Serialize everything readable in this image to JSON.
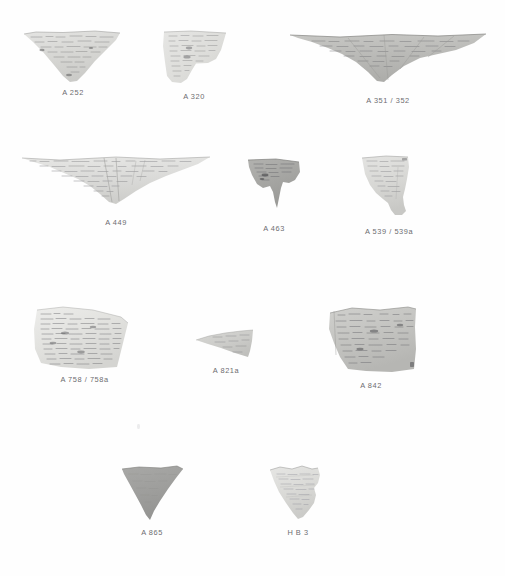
{
  "plate": {
    "title": "Manuscript fragments plate",
    "background_color": "#ffffff",
    "label_color": "#6d6d70",
    "width": 505,
    "height": 576,
    "row_count": 4,
    "fragment_count": 11
  },
  "fragments": [
    {
      "id": "a-252",
      "label": "A 252",
      "row": 1,
      "shape": "inverted-triangle-wedge",
      "fill": "#d8d8d6",
      "tone": "light",
      "x": 23,
      "y": 30,
      "w": 100,
      "h": 55,
      "label_y": 58,
      "ink": "dense-handwriting"
    },
    {
      "id": "a-320",
      "label": "A 320",
      "row": 1,
      "shape": "right-triangle-step",
      "fill": "#dededc",
      "tone": "light",
      "x": 160,
      "y": 30,
      "w": 68,
      "h": 54,
      "label_y": 62,
      "ink": "dense-handwriting"
    },
    {
      "id": "a-351-352",
      "label": "A 351 / 352",
      "row": 1,
      "shape": "wide-chevron",
      "fill": "#b9b9b6",
      "tone": "medium",
      "x": 288,
      "y": 33,
      "w": 200,
      "h": 52,
      "label_y": 63,
      "ink": "dense-handwriting"
    },
    {
      "id": "a-449",
      "label": "A 449",
      "row": 2,
      "shape": "wide-chevron-shallow",
      "fill": "#dcdcda",
      "tone": "light",
      "x": 20,
      "y": 155,
      "w": 192,
      "h": 52,
      "label_y": 63,
      "ink": "dense-handwriting"
    },
    {
      "id": "a-463",
      "label": "A 463",
      "row": 2,
      "shape": "notched-triangle-with-tail",
      "fill": "#a9a9a6",
      "tone": "dark",
      "x": 243,
      "y": 158,
      "w": 62,
      "h": 62,
      "label_y": 66,
      "ink": "sparse-handwriting"
    },
    {
      "id": "a-539-539a",
      "label": "A 539 / 539a",
      "row": 2,
      "shape": "tapered-keystone-with-foot",
      "fill": "#dadad8",
      "tone": "light",
      "x": 358,
      "y": 155,
      "w": 62,
      "h": 68,
      "label_y": 72,
      "ink": "dense-handwriting"
    },
    {
      "id": "a-758-758a",
      "label": "A 758 / 758a",
      "row": 3,
      "shape": "quadrilateral-sheet",
      "fill": "#e2e2e0",
      "tone": "light",
      "x": 33,
      "y": 305,
      "w": 103,
      "h": 66,
      "label_y": 70,
      "ink": "very-dense-handwriting"
    },
    {
      "id": "a-821a",
      "label": "A 821a",
      "row": 3,
      "shape": "thin-left-wedge",
      "fill": "#cfcfcc",
      "tone": "medium",
      "x": 195,
      "y": 329,
      "w": 62,
      "h": 31,
      "label_y": 37,
      "ink": "faint-handwriting"
    },
    {
      "id": "a-842",
      "label": "A 842",
      "row": 3,
      "shape": "rectangle-clipped-corner",
      "fill": "#c6c6c3",
      "tone": "medium",
      "x": 322,
      "y": 305,
      "w": 98,
      "h": 72,
      "label_y": 76,
      "ink": "dense-handwriting"
    },
    {
      "id": "a-865",
      "label": "A 865",
      "row": 4,
      "shape": "inverted-triangle-solid",
      "fill": "#9f9f9d",
      "tone": "dark",
      "x": 119,
      "y": 465,
      "w": 66,
      "h": 58,
      "label_y": 63,
      "ink": "none-visible"
    },
    {
      "id": "h-b-3",
      "label": "H B 3",
      "row": 4,
      "shape": "irregular-inverted-triangle",
      "fill": "#dcdcda",
      "tone": "light",
      "x": 268,
      "y": 465,
      "w": 60,
      "h": 58,
      "label_y": 63,
      "ink": "ruled-handwriting"
    }
  ],
  "artifacts": [
    {
      "id": "speck-1",
      "name": "dust-speck",
      "x": 137,
      "y": 424
    }
  ]
}
